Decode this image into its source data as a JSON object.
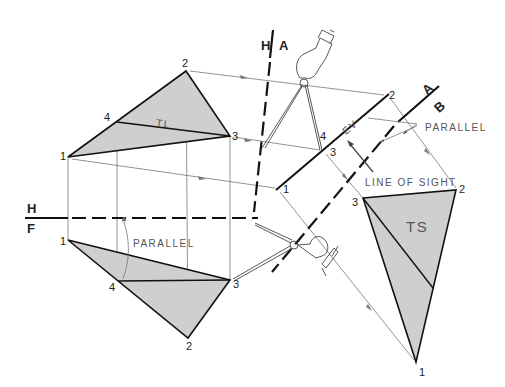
{
  "figure": {
    "type": "descriptive-geometry-true-shape-construction",
    "colors": {
      "fill": "#cfcfcf",
      "line": "#111111",
      "thin": "#666666",
      "text": "#555555"
    }
  },
  "fold_lines": {
    "hf": {
      "top": "H",
      "bottom": "F"
    },
    "ha": {
      "left": "H",
      "right": "A"
    },
    "ab": {
      "top": "A",
      "bottom": "B"
    }
  },
  "top_view": {
    "points": {
      "p1": "1",
      "p2": "2",
      "p3": "3",
      "p4": "4"
    },
    "label": "TL"
  },
  "front_view": {
    "points": {
      "p1": "1",
      "p2": "2",
      "p3": "3",
      "p4": "4"
    },
    "parallel_note": "PARALLEL"
  },
  "aux_view_a": {
    "points": {
      "p1": "1",
      "p2": "2",
      "p3": "3",
      "p4": "4"
    },
    "label": "EV",
    "parallel_note": "PARALLEL",
    "line_of_sight": "LINE OF SIGHT"
  },
  "aux_view_b": {
    "points": {
      "p1": "1",
      "p2": "2",
      "p3": "3"
    },
    "label": "TS"
  }
}
